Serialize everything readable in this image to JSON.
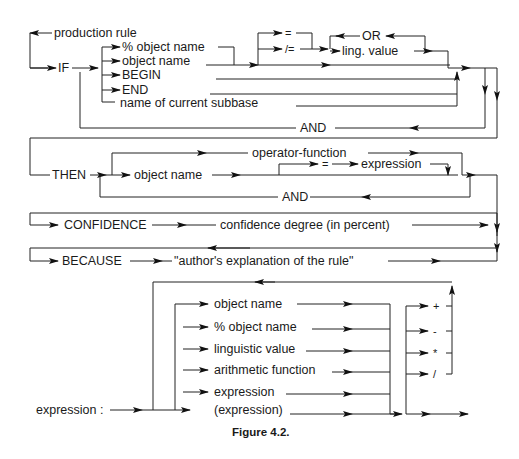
{
  "figure": {
    "caption": "Figure 4.2.",
    "production_rule": {
      "title": "production rule",
      "if_keyword": "IF",
      "condition_items": [
        "% object name",
        "object name",
        "BEGIN",
        "END",
        "name of current subbase"
      ],
      "operators": [
        "=",
        "/="
      ],
      "or_label": "OR",
      "ling_value": "ling. value",
      "and_label_if": "AND",
      "then_keyword": "THEN",
      "then_object": "object name",
      "operator_function": "operator-function",
      "assign_op": "=",
      "assign_expression": "expression",
      "and_label_then": "AND",
      "confidence_keyword": "CONFIDENCE",
      "confidence_value": "confidence degree (in percent)",
      "because_keyword": "BECAUSE",
      "because_value": "\"author's explanation of the rule\""
    },
    "expression_rule": {
      "label": "expression :",
      "items": [
        "object name",
        "% object name",
        "linguistic value",
        "arithmetic function",
        "expression",
        "(expression)"
      ],
      "arith_operators": [
        "+",
        "-",
        "*",
        "/"
      ]
    }
  }
}
